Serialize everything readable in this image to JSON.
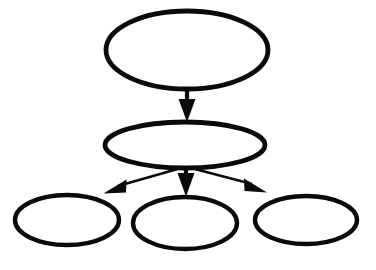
{
  "diagram": {
    "type": "tree",
    "title": "",
    "orientation": "top-down",
    "canvas": {
      "width": 376,
      "height": 270
    },
    "style": {
      "background_color": "#ffffff",
      "node_fill": "#ffffff",
      "node_stroke": "#0a0a0a",
      "node_stroke_width": 4.6,
      "edge_color": "#0a0a0a",
      "edge_width": 2.2,
      "shape": "ellipse",
      "labels_visible": false
    },
    "nodes": [
      {
        "id": "root",
        "label": "",
        "level": 0,
        "cx": 187,
        "cy": 50,
        "rx": 81,
        "ry": 39,
        "stroke_width": 4.8
      },
      {
        "id": "mid",
        "label": "",
        "level": 1,
        "cx": 185,
        "cy": 145,
        "rx": 80,
        "ry": 23,
        "stroke_width": 4.8
      },
      {
        "id": "leaf-left",
        "label": "",
        "level": 2,
        "cx": 67,
        "cy": 220,
        "rx": 52,
        "ry": 25,
        "stroke_width": 4.4
      },
      {
        "id": "leaf-center",
        "label": "",
        "level": 2,
        "cx": 185,
        "cy": 223,
        "rx": 52,
        "ry": 26,
        "stroke_width": 4.4
      },
      {
        "id": "leaf-right",
        "label": "",
        "level": 2,
        "cx": 306,
        "cy": 220,
        "rx": 51,
        "ry": 24,
        "stroke_width": 4.4
      }
    ],
    "edges": [
      {
        "id": "edge-root-mid",
        "from": "root",
        "to": "mid",
        "label": "",
        "direction": "down",
        "x1": 187,
        "y1": 89,
        "x2": 187,
        "y2": 122,
        "arrowhead": "solid-triangle"
      },
      {
        "id": "edge-mid-left",
        "from": "mid",
        "to": "leaf-left",
        "label": "",
        "direction": "down-left",
        "x1": 180,
        "y1": 168,
        "x2": 104,
        "y2": 195,
        "arrowhead": "solid-triangle"
      },
      {
        "id": "edge-mid-center",
        "from": "mid",
        "to": "leaf-center",
        "label": "",
        "direction": "down",
        "x1": 186,
        "y1": 168,
        "x2": 186,
        "y2": 196,
        "arrowhead": "solid-triangle"
      },
      {
        "id": "edge-mid-right",
        "from": "mid",
        "to": "leaf-right",
        "label": "",
        "direction": "down-right",
        "x1": 192,
        "y1": 168,
        "x2": 266,
        "y2": 194,
        "arrowhead": "solid-triangle"
      }
    ]
  }
}
